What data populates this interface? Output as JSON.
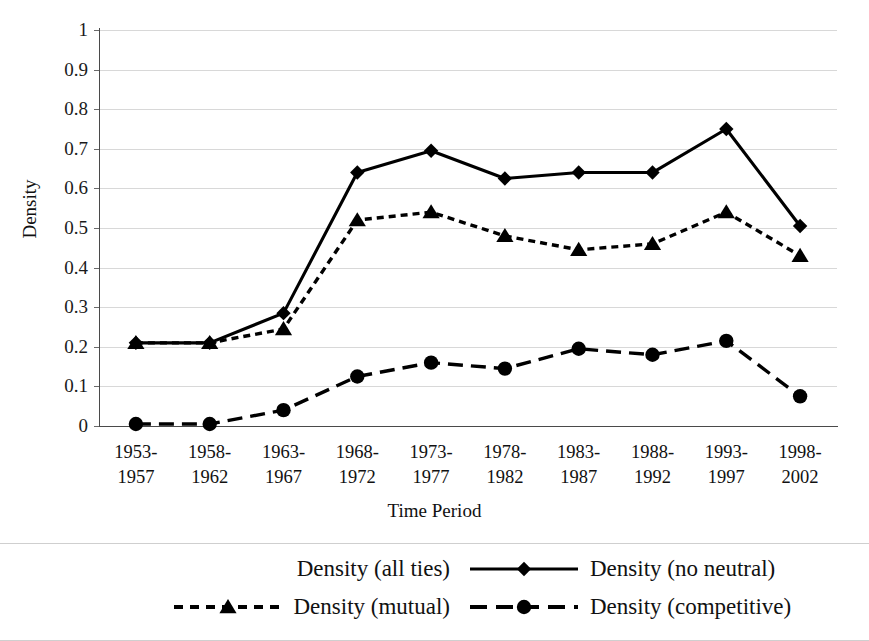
{
  "chart_data": {
    "type": "line",
    "title": "",
    "xlabel": "Time Period",
    "ylabel": "Density",
    "ylim": [
      0,
      1
    ],
    "ytick_labels": [
      "1",
      "0.9",
      "0.8",
      "0.7",
      "0.6",
      "0.5",
      "0.4",
      "0.3",
      "0.2",
      "0.1",
      "0"
    ],
    "ytick_values": [
      1,
      0.9,
      0.8,
      0.7,
      0.6,
      0.5,
      0.4,
      0.3,
      0.2,
      0.1,
      0
    ],
    "grid": true,
    "legend_position": "bottom",
    "categories": [
      "1953-1957",
      "1958-1962",
      "1963-1967",
      "1968-1972",
      "1973-1977",
      "1978-1982",
      "1983-1987",
      "1988-1992",
      "1993-1997",
      "1998-2002"
    ],
    "category_lines": [
      [
        "1953-",
        "1957"
      ],
      [
        "1958-",
        "1962"
      ],
      [
        "1963-",
        "1967"
      ],
      [
        "1968-",
        "1972"
      ],
      [
        "1973-",
        "1977"
      ],
      [
        "1978-",
        "1982"
      ],
      [
        "1983-",
        "1987"
      ],
      [
        "1988-",
        "1992"
      ],
      [
        "1993-",
        "1997"
      ],
      [
        "1998-",
        "2002"
      ]
    ],
    "series": [
      {
        "name": "Density (all ties)",
        "marker": "none",
        "line_style": "none",
        "color": "#ffffff",
        "values": [
          null,
          null,
          null,
          null,
          null,
          null,
          null,
          null,
          null,
          null
        ]
      },
      {
        "name": "Density (no neutral)",
        "marker": "diamond",
        "line_style": "solid",
        "color": "#000000",
        "values": [
          0.21,
          0.21,
          0.285,
          0.64,
          0.695,
          0.625,
          0.64,
          0.64,
          0.75,
          0.505
        ]
      },
      {
        "name": "Density (mutual)",
        "marker": "triangle",
        "line_style": "dotted",
        "color": "#000000",
        "values": [
          0.21,
          0.21,
          0.245,
          0.52,
          0.54,
          0.48,
          0.445,
          0.46,
          0.54,
          0.43
        ]
      },
      {
        "name": "Density (competitive)",
        "marker": "circle",
        "line_style": "dashed",
        "color": "#000000",
        "values": [
          0.005,
          0.005,
          0.04,
          0.125,
          0.16,
          0.145,
          0.195,
          0.18,
          0.215,
          0.075
        ]
      }
    ]
  },
  "legend": {
    "entries": [
      {
        "label": "Density (all ties)",
        "marker": "none",
        "line_style": "none"
      },
      {
        "label": "Density (no neutral)",
        "marker": "diamond",
        "line_style": "solid"
      },
      {
        "label": "Density (mutual)",
        "marker": "triangle",
        "line_style": "dotted"
      },
      {
        "label": "Density (competitive)",
        "marker": "circle",
        "line_style": "dashed"
      }
    ]
  },
  "axes": {
    "y_title": "Density",
    "x_title": "Time Period"
  }
}
